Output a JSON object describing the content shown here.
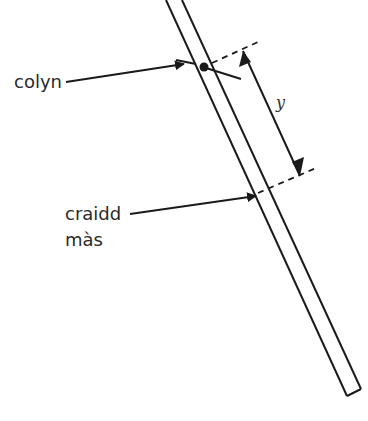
{
  "diagram": {
    "type": "physics-diagram",
    "labels": {
      "pivot": "colyn",
      "centre_of_mass_line1": "craidd",
      "centre_of_mass_line2": "màs",
      "distance": "y"
    },
    "colors": {
      "stroke": "#1a1a1a",
      "text": "#2a2a2a",
      "background": "#ffffff"
    }
  }
}
